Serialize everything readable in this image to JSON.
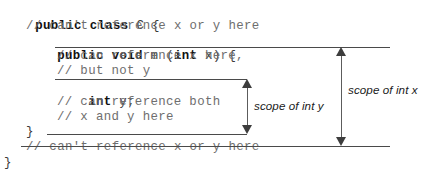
{
  "diagram": {
    "colors": {
      "code_keyword": "#111111",
      "code_comment": "#7a7a7a",
      "annotation_line": "#4a4a4a",
      "arrow": "#3d3d3d",
      "background": "#ffffff"
    }
  },
  "code": {
    "lines": [
      {
        "indent": 0,
        "text": "public class C {",
        "kw": "public class",
        "rest": " C {"
      },
      {
        "indent": 1,
        "text": "// can't reference x or y here",
        "comment": true
      },
      {
        "indent": 1,
        "text": "public void m (int x) {",
        "kw": "public void",
        "rest": " m (",
        "kw2": "int",
        "rest2": " x) {"
      },
      {
        "indent": 2,
        "text": "// can reference x here,",
        "comment": true
      },
      {
        "indent": 2,
        "text": "// but not y",
        "comment": true
      },
      {
        "indent": 2,
        "text": "int y;",
        "kw": "int",
        "rest": " y;"
      },
      {
        "indent": 2,
        "text": "// can reference both",
        "comment": true
      },
      {
        "indent": 2,
        "text": "// x and y here",
        "comment": true
      },
      {
        "indent": 1,
        "text": "}",
        "comment": false
      },
      {
        "indent": 1,
        "text": "// can't reference x or y here",
        "comment": true
      },
      {
        "indent": 0,
        "text": "}",
        "comment": false
      }
    ],
    "line_1": "public class C {",
    "line_2": "// can't reference x or y here",
    "line_3": "public void m (int x) {",
    "line_4": "// can reference x here,",
    "line_5": "// but not y",
    "line_6": "int y;",
    "line_7": "// can reference both",
    "line_8": "// x and y here",
    "line_9": "}",
    "line_10": "// can't reference x or y here",
    "line_11": "}",
    "tokens": {
      "public_class": "public class",
      "c_brace": " C {",
      "public_void": "public void",
      "m_open": " m (",
      "int": "int",
      "x_close": " x) {",
      "int_y": "int",
      "y_semi": " y;"
    }
  },
  "annotations": {
    "scope_y_label": "scope of int y",
    "scope_x_label": "scope of int x"
  }
}
